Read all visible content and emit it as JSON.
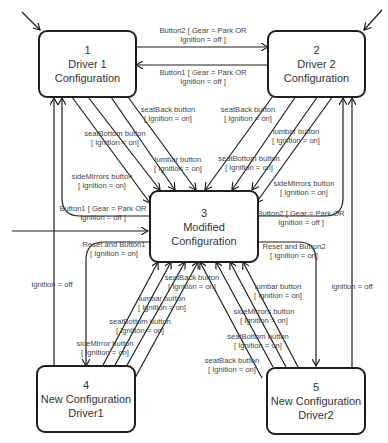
{
  "states": [
    {
      "id": "1",
      "name_line1": "Driver 1",
      "name_line2": "Configuration"
    },
    {
      "id": "2",
      "name_line1": "Driver 2",
      "name_line2": "Configuration"
    },
    {
      "id": "3",
      "name_line1": "Modified",
      "name_line2": "Configuration"
    },
    {
      "id": "4",
      "name_line1": "New Configuration",
      "name_line2": "Driver1"
    },
    {
      "id": "5",
      "name_line1": "New Configuration",
      "name_line2": "Driver2"
    }
  ],
  "transitions": {
    "t1_to_2": {
      "event": "Button2 [ Gear = Park OR",
      "guard": "Ignition = off ]"
    },
    "t2_to_1": {
      "event": "Button1 [ Gear = Park OR",
      "guard": "Ignition = off ]"
    },
    "t1_seatback": {
      "event": "seatBack button",
      "guard": "[ Ignition = on]"
    },
    "t1_seatbottom": {
      "event": "seatBottom button",
      "guard": "[ Ignition = on]"
    },
    "t1_lumbar": {
      "event": "lumbar button",
      "guard": "[ Ignition = on]"
    },
    "t1_sidemirrors": {
      "event": "sideMirrors button",
      "guard": "[ Ignition = on]"
    },
    "t2_seatback": {
      "event": "seatBack button",
      "guard": "[ Ignition = on]"
    },
    "t2_lumbar": {
      "event": "lumbar button",
      "guard": "[ Ignition = on]"
    },
    "t2_seatbottom": {
      "event": "seatBottom button",
      "guard": "[ Ignition = on]"
    },
    "t2_sidemirrors": {
      "event": "sideMirrors button",
      "guard": "[ Ignition = on]"
    },
    "t3_to_1": {
      "event": "Button1 [ Gear = Park OR",
      "guard": "Ignition = off ]"
    },
    "t3_to_2": {
      "event": "Button2 [ Gear = Park OR",
      "guard": "Ignition = off ]"
    },
    "t3_to_4": {
      "event": "Reset and Button1",
      "guard": "[ Ignition = on]"
    },
    "t3_to_5": {
      "event": "Reset and Button2",
      "guard": "[ Ignition = on]"
    },
    "t4_to_1": {
      "event": "ignition = off"
    },
    "t5_to_2": {
      "event": "ignition = off"
    },
    "t4_seatback": {
      "event": "seatBack button",
      "guard": "[ Ignition = on]"
    },
    "t4_lumbar": {
      "event": "lumbar button",
      "guard": "[ Ignition = on]"
    },
    "t4_seatbottom": {
      "event": "seatBottom button",
      "guard": "[ Ignition = on]"
    },
    "t4_sidemirrors": {
      "event": "sideMirror button",
      "guard": "[ Ignition = on]"
    },
    "t5_lumbar": {
      "event": "lumbar button",
      "guard": "[ Ignition = on]"
    },
    "t5_sidemirrors": {
      "event": "sideMirrors button",
      "guard": "[ Ignition = on]"
    },
    "t5_seatbottom": {
      "event": "seatBottom button",
      "guard": "[ Ignition = on]"
    },
    "t5_seatback": {
      "event": "seatBack button",
      "guard": "[ Ignition = on]"
    }
  },
  "colors": {
    "line": "#1e1e1e",
    "text": "#444444",
    "background": "#ffffff"
  }
}
